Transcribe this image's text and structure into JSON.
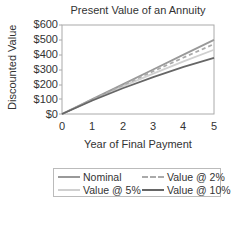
{
  "chart_data": {
    "type": "line",
    "title": "Present Value of an Annuity",
    "xlabel": "Year of Final Payment",
    "ylabel": "Discounted Value",
    "x": [
      0,
      1,
      2,
      3,
      4,
      5
    ],
    "xticks": [
      "0",
      "1",
      "2",
      "3",
      "4",
      "5"
    ],
    "yticks": [
      "$0",
      "$100",
      "$200",
      "$300",
      "$400",
      "$500",
      "$600"
    ],
    "ylim": [
      0,
      600
    ],
    "xlim": [
      0,
      5
    ],
    "grid": false,
    "legend_position": "bottom",
    "series": [
      {
        "name": "Nominal",
        "values": [
          0,
          100,
          200,
          300,
          400,
          500
        ],
        "color": "#999999",
        "dash": "solid"
      },
      {
        "name": "Value @ 2%",
        "values": [
          0,
          98.04,
          194.16,
          288.39,
          380.77,
          471.35
        ],
        "color": "#aaaaaa",
        "dash": "dashed"
      },
      {
        "name": "Value @ 5%",
        "values": [
          0,
          95.24,
          185.94,
          272.32,
          354.6,
          432.95
        ],
        "color": "#d0d0d0",
        "dash": "solid"
      },
      {
        "name": "Value @ 10%",
        "values": [
          0,
          90.91,
          173.55,
          248.69,
          316.99,
          379.08
        ],
        "color": "#666666",
        "dash": "solid"
      }
    ]
  },
  "legend": {
    "items": [
      "Nominal",
      "Value @ 2%",
      "Value @ 5%",
      "Value @ 10%"
    ]
  }
}
